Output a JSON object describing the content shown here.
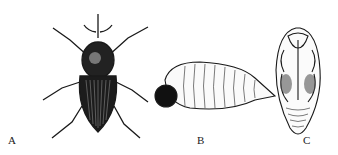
{
  "figure": {
    "panels": [
      {
        "label": "A",
        "subject": "adult weevil (dorsal view)"
      },
      {
        "label": "B",
        "subject": "larva (lateral view)"
      },
      {
        "label": "C",
        "subject": "pupa (ventral view)"
      }
    ],
    "colors": {
      "ink": "#1a1a1a",
      "background": "#ffffff"
    }
  }
}
